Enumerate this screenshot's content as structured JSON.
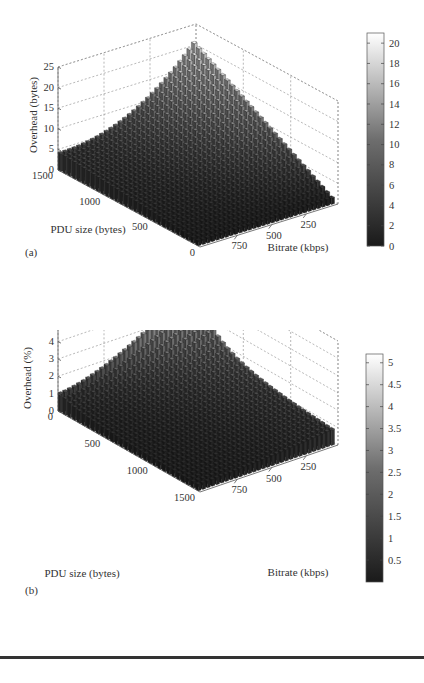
{
  "figure": {
    "panels": [
      {
        "id": "a",
        "panel_label": "(a)",
        "zlabel": "Overhead (bytes)",
        "xlabel": "PDU size (bytes)",
        "ylabel": "Bitrate (kbps)",
        "z_ticks": [
          "0",
          "5",
          "10",
          "15",
          "20",
          "25"
        ],
        "pdu_ticks": [
          "1500",
          "1000",
          "500",
          "0"
        ],
        "bitrate_ticks": [
          "750",
          "500",
          "250"
        ],
        "colorbar_ticks": [
          "0",
          "2",
          "4",
          "6",
          "8",
          "10",
          "12",
          "14",
          "16",
          "18",
          "20"
        ]
      },
      {
        "id": "b",
        "panel_label": "(b)",
        "zlabel": "Overhead (%)",
        "xlabel": "PDU size (bytes)",
        "ylabel": "Bitrate (kbps)",
        "z_ticks": [
          "0",
          "1",
          "2",
          "3",
          "4",
          "5",
          "6"
        ],
        "pdu_ticks": [
          "0",
          "500",
          "1000",
          "1500"
        ],
        "bitrate_ticks": [
          "750",
          "500",
          "250"
        ],
        "colorbar_ticks": [
          "0.5",
          "1",
          "1.5",
          "2",
          "2.5",
          "3",
          "3.5",
          "4",
          "4.5",
          "5"
        ]
      }
    ]
  },
  "chart_data": [
    {
      "type": "bar3d",
      "title": "",
      "panel": "(a)",
      "xlabel": "PDU size (bytes)",
      "ylabel": "Bitrate (kbps)",
      "zlabel": "Overhead (bytes)",
      "x_range": [
        0,
        1500
      ],
      "y_range": [
        50,
        900
      ],
      "zlim": [
        0,
        25
      ],
      "colorbar_range": [
        0,
        21
      ],
      "grid": true,
      "colormap": "gray",
      "x_ticks": [
        0,
        500,
        1000,
        1500
      ],
      "y_ticks": [
        250,
        500,
        750
      ],
      "z_ticks": [
        0,
        5,
        10,
        15,
        20,
        25
      ],
      "grid_size": [
        30,
        30
      ],
      "description": "Overhead in bytes increases with PDU size and decreases with bitrate; peak about 22 bytes at PDU 1500 and lowest bitrate, about 4.5 at PDU 1500 and highest bitrate, about 1-2 at PDU near 0",
      "series": [
        {
          "name": "PDU=1500",
          "bitrate": [
            50,
            250,
            500,
            750,
            900
          ],
          "values": [
            22,
            13,
            8,
            5.5,
            4.5
          ]
        },
        {
          "name": "PDU=1000",
          "bitrate": [
            50,
            250,
            500,
            750,
            900
          ],
          "values": [
            15,
            9,
            5.5,
            4,
            3.2
          ]
        },
        {
          "name": "PDU=500",
          "bitrate": [
            50,
            250,
            500,
            750,
            900
          ],
          "values": [
            8,
            5,
            3.2,
            2.5,
            2
          ]
        },
        {
          "name": "PDU=0",
          "bitrate": [
            50,
            250,
            500,
            750,
            900
          ],
          "values": [
            2,
            1.5,
            1.2,
            1,
            1
          ]
        }
      ]
    },
    {
      "type": "bar3d",
      "title": "",
      "panel": "(b)",
      "xlabel": "PDU size (bytes)",
      "ylabel": "Bitrate (kbps)",
      "zlabel": "Overhead (%)",
      "x_range": [
        0,
        1500
      ],
      "y_range": [
        50,
        900
      ],
      "zlim": [
        0,
        6
      ],
      "colorbar_range": [
        0,
        5.2
      ],
      "grid": true,
      "colormap": "gray",
      "x_ticks": [
        0,
        500,
        1000,
        1500
      ],
      "y_ticks": [
        250,
        500,
        750
      ],
      "z_ticks": [
        0,
        1,
        2,
        3,
        4,
        5,
        6
      ],
      "grid_size": [
        30,
        30
      ],
      "description": "Overhead percent is highest at small PDU sizes and low bitrate (peak about 5.3%), falls off with PDU size; about 3.7% at PDU near 0 and highest bitrate",
      "series": [
        {
          "name": "PDU≈50",
          "bitrate": [
            50,
            250,
            500,
            750,
            900
          ],
          "values": [
            5.3,
            4.6,
            4.2,
            3.9,
            3.7
          ]
        },
        {
          "name": "PDU=500",
          "bitrate": [
            50,
            250,
            500,
            750,
            900
          ],
          "values": [
            2.6,
            1.9,
            1.4,
            1.1,
            1.0
          ]
        },
        {
          "name": "PDU=1000",
          "bitrate": [
            50,
            250,
            500,
            750,
            900
          ],
          "values": [
            1.9,
            1.3,
            0.9,
            0.7,
            0.6
          ]
        },
        {
          "name": "PDU=1500",
          "bitrate": [
            50,
            250,
            500,
            750,
            900
          ],
          "values": [
            1.5,
            1.0,
            0.7,
            0.55,
            0.5
          ]
        }
      ]
    }
  ]
}
